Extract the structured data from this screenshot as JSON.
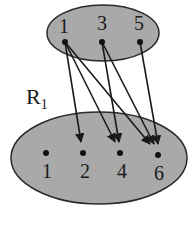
{
  "diagram": {
    "relation_label": "R",
    "relation_subscript": "1",
    "colors": {
      "set_fill": "#a9a9a9",
      "set_stroke": "#2a2a2a",
      "edge": "#1a1a1a",
      "node": "#111111"
    },
    "domain_set": {
      "nodes": [
        {
          "id": "d1",
          "label": "1",
          "x": 65,
          "y": 42
        },
        {
          "id": "d3",
          "label": "3",
          "x": 102,
          "y": 42
        },
        {
          "id": "d5",
          "label": "5",
          "x": 140,
          "y": 42
        }
      ]
    },
    "codomain_set": {
      "nodes": [
        {
          "id": "c1",
          "label": "1",
          "x": 46,
          "y": 153
        },
        {
          "id": "c2",
          "label": "2",
          "x": 83,
          "y": 153
        },
        {
          "id": "c4",
          "label": "4",
          "x": 120,
          "y": 153
        },
        {
          "id": "c6",
          "label": "6",
          "x": 158,
          "y": 155
        }
      ]
    },
    "edges": [
      {
        "from": "1",
        "to": "2"
      },
      {
        "from": "1",
        "to": "4"
      },
      {
        "from": "1",
        "to": "6"
      },
      {
        "from": "3",
        "to": "4"
      },
      {
        "from": "3",
        "to": "6"
      },
      {
        "from": "5",
        "to": "6"
      }
    ]
  }
}
